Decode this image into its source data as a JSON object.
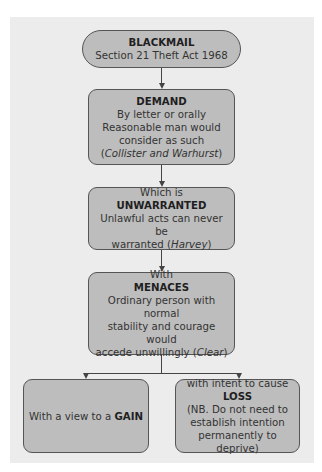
{
  "diagram": {
    "title_box": {
      "heading": "BLACKMAIL",
      "subtitle": "Section 21 Theft Act 1968"
    },
    "demand_box": {
      "heading": "DEMAND",
      "line1": "By letter or orally",
      "line2": "Reasonable man would",
      "line3": "consider as such",
      "case_open": "(",
      "case": "Collister and Warhurst",
      "case_close": ")"
    },
    "unwarranted_box": {
      "prefix": "Which is",
      "heading": "UNWARRANTED",
      "line1": "Unlawful acts can never be",
      "line2_pre": "warranted (",
      "case": "Harvey",
      "line2_post": ")"
    },
    "menaces_box": {
      "prefix": "With",
      "heading": "MENACES",
      "line1": "Ordinary person with normal",
      "line2": "stability and courage would",
      "line3_pre": "accede unwillingly (",
      "case": "Clear",
      "line3_post": ")"
    },
    "gain_box": {
      "text_pre": "With a view to a ",
      "heading": "GAIN"
    },
    "loss_box": {
      "prefix": "with intent to cause",
      "heading": "LOSS",
      "line1": "(NB. Do not need to",
      "line2": "establish intention",
      "line3": "permanently to deprive)"
    },
    "colors": {
      "panel_background": "#ececec",
      "box_fill": "#bdbdbd",
      "box_border": "#555555",
      "connector": "#444444"
    }
  }
}
